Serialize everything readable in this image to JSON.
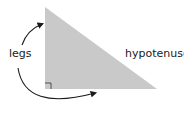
{
  "diagram": {
    "labels": {
      "legs": "legs",
      "hypotenuse": "hypotenuse"
    },
    "colors": {
      "triangle_fill": "#c9c9c9",
      "stroke": "#1a1a1a"
    },
    "elements": [
      "right-triangle",
      "right-angle-marker",
      "arrow-to-vertical-leg",
      "arrow-to-horizontal-leg"
    ]
  }
}
